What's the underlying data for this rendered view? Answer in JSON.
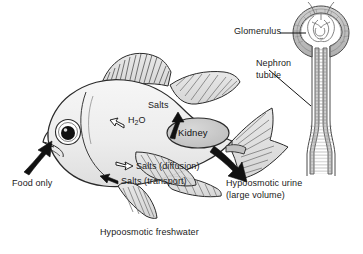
{
  "figure": {
    "caption": "Hypoosmotic freshwater",
    "background_color": "#ffffff",
    "ink_color": "#1a1a1a"
  },
  "fish": {
    "body_fill": "#efefef",
    "fin_fill": "#e3e3e3",
    "organ_fill": "#c9c9c9",
    "organ_label": "Kidney",
    "eye": {
      "sclera_color": "#ffffff",
      "pupil_color": "#101010"
    }
  },
  "nephron": {
    "capsule_fill": "#bdbdbd",
    "tubule_fill": "#c4c4c4",
    "labels": {
      "glomerulus": "Glomerulus",
      "tubule_line1": "Nephron",
      "tubule_line2": "tubule"
    }
  },
  "flows": {
    "food": {
      "label": "Food only",
      "arrow_style": "solid",
      "arrow_color": "#111111",
      "direction": "into-mouth"
    },
    "water_in": {
      "label": "H",
      "label_sub": "2",
      "label_tail": "O",
      "arrow_style": "hollow",
      "direction": "into-body"
    },
    "salts_to_kidney": {
      "label": "Salts",
      "arrow_style": "solid",
      "direction": "up-toward-kidney"
    },
    "salts_diffusion": {
      "label": "Salts (diffusion)",
      "arrow_style": "hollow",
      "direction": "out-of-body"
    },
    "salts_transport": {
      "label": "Salts (transport)",
      "arrow_style": "solid",
      "direction": "into-body"
    },
    "urine": {
      "line1": "Hypoosmotic urine",
      "line2": "(large volume)",
      "arrow_style": "solid",
      "direction": "out-and-down"
    }
  }
}
